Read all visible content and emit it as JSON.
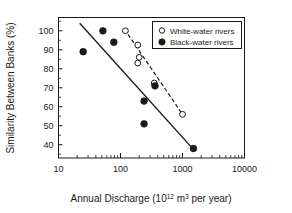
{
  "chart_data": {
    "type": "scatter",
    "title": "",
    "xlabel": "Annual Discharge (10^12 m3 per year)",
    "xlabel_main": "Annual Discharge (10",
    "xlabel_sup1": "12",
    "xlabel_mid": " m",
    "xlabel_sup2": "3",
    "xlabel_tail": " per year)",
    "ylabel": "Similarity Between Banks (%)",
    "xscale": "log",
    "yscale": "linear",
    "xlim": [
      10,
      10000
    ],
    "ylim": [
      33,
      107
    ],
    "grid": false,
    "legend_position": "top-right",
    "xticks": [
      "10",
      "100",
      "1000",
      "10000"
    ],
    "xtick_values": [
      10,
      100,
      1000,
      10000
    ],
    "yticks": [
      "100",
      "90",
      "80",
      "70",
      "60",
      "50",
      "40"
    ],
    "ytick_values": [
      100,
      90,
      80,
      70,
      60,
      50,
      40
    ],
    "series": [
      {
        "name": "White-water rivers",
        "marker": "open-circle",
        "color": "#ffffff",
        "edge_color": "#1a1a1a",
        "points": [
          {
            "x": 120,
            "y": 100
          },
          {
            "x": 190,
            "y": 92.5
          },
          {
            "x": 200,
            "y": 86
          },
          {
            "x": 190,
            "y": 83
          },
          {
            "x": 350,
            "y": 72.5
          },
          {
            "x": 1000,
            "y": 56
          }
        ],
        "trend_line": {
          "style": "dashed",
          "x1": 115,
          "y1": 101,
          "x2": 1050,
          "y2": 55
        }
      },
      {
        "name": "Black-water rivers",
        "marker": "filled-circle",
        "color": "#1a1a1a",
        "edge_color": "#1a1a1a",
        "points": [
          {
            "x": 25,
            "y": 89
          },
          {
            "x": 52,
            "y": 100
          },
          {
            "x": 78,
            "y": 94
          },
          {
            "x": 240,
            "y": 63
          },
          {
            "x": 240,
            "y": 51
          },
          {
            "x": 360,
            "y": 71
          },
          {
            "x": 1500,
            "y": 38
          }
        ],
        "trend_line": {
          "style": "solid",
          "x1": 22,
          "y1": 104,
          "x2": 1550,
          "y2": 37
        }
      }
    ],
    "legend": [
      {
        "label": "White-water rivers",
        "marker": "open-circle"
      },
      {
        "label": "Black-water rivers",
        "marker": "filled-circle"
      }
    ]
  }
}
